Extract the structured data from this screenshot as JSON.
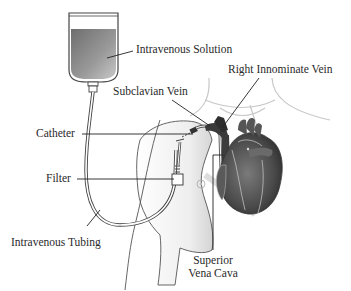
{
  "diagram": {
    "labels": {
      "intravenous_solution": "Intravenous Solution",
      "subclavian_vein": "Subclavian Vein",
      "right_innominate_vein": "Right Innominate Vein",
      "catheter": "Catheter",
      "filter": "Filter",
      "intravenous_tubing": "Intravenous Tubing",
      "superior_vena_cava_line1": "Superior",
      "superior_vena_cava_line2": "Vena Cava"
    },
    "components": [
      "iv-bag",
      "iv-tubing",
      "filter",
      "catheter",
      "subclavian-vein",
      "right-innominate-vein",
      "superior-vena-cava",
      "heart",
      "torso-outline"
    ],
    "colors": {
      "fluid": "#8a8a8a",
      "heart": "#4a4a4a",
      "outline": "#333333",
      "skin_shading": "#d8d8d8",
      "background": "#ffffff"
    }
  }
}
